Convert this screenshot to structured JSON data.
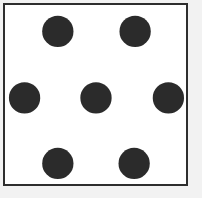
{
  "figure": {
    "canvas_width": 202,
    "canvas_height": 198,
    "outer_background_color": "#f2f2f2",
    "panel_background_color": "#ffffff",
    "border_color": "#2e2e2e",
    "border_width": 2,
    "dot_color": "#2b2b2b",
    "dot_count": 7
  },
  "panel": {
    "left": 3,
    "top": 3,
    "width": 185,
    "height": 183
  },
  "chart_data": {
    "type": "scatter",
    "xlabel": "",
    "ylabel": "",
    "xlim": [
      0,
      202
    ],
    "ylim": [
      0,
      198
    ],
    "grid": false,
    "legend": "none",
    "marker": "circle",
    "marker_color": "#2b2b2b",
    "marker_radius": 16,
    "series": [
      {
        "name": "dots",
        "points": [
          {
            "label": "top-left",
            "x": 57,
            "y": 30,
            "r": 16
          },
          {
            "label": "top-right",
            "x": 136,
            "y": 30,
            "r": 16
          },
          {
            "label": "middle-left",
            "x": 23,
            "y": 98,
            "r": 16
          },
          {
            "label": "center",
            "x": 96,
            "y": 98,
            "r": 16
          },
          {
            "label": "middle-right",
            "x": 170,
            "y": 98,
            "r": 16
          },
          {
            "label": "bottom-left",
            "x": 57,
            "y": 165,
            "r": 16
          },
          {
            "label": "bottom-right",
            "x": 135,
            "y": 165,
            "r": 16
          }
        ]
      }
    ]
  }
}
